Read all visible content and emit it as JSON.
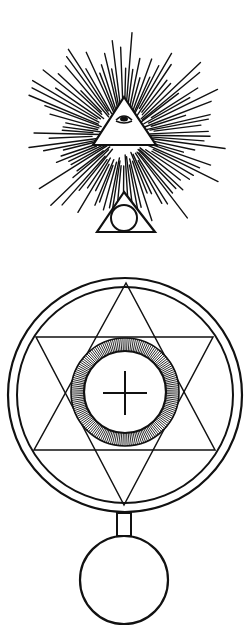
{
  "figure": {
    "colors": {
      "ink": "#111111",
      "paper": "#ffffff"
    },
    "upper_emblem": {
      "rays": {
        "center": [
          124,
          135
        ],
        "count": 96,
        "inner_radius": 30,
        "outer_radius_min": 58,
        "outer_radius_max": 108
      },
      "eye_triangle": {
        "points": [
          [
            124,
            97
          ],
          [
            93,
            145
          ],
          [
            156,
            145
          ]
        ]
      },
      "small_triangle": {
        "points": [
          [
            124,
            192
          ],
          [
            97,
            232
          ],
          [
            155,
            232
          ]
        ]
      },
      "small_circle": {
        "center": [
          124,
          218
        ],
        "r": 13
      }
    },
    "lower_emblem": {
      "outer_circle": {
        "center": [
          125,
          395
        ],
        "r": 117
      },
      "inner_circle": {
        "center": [
          125,
          395
        ],
        "r": 108
      },
      "hexagram": {
        "up_triangle": [
          [
            126,
            283
          ],
          [
            34,
            450
          ],
          [
            215,
            450
          ]
        ],
        "down_triangle": [
          [
            36,
            337
          ],
          [
            213,
            337
          ],
          [
            124,
            505
          ]
        ]
      },
      "hatched_ring": {
        "center": [
          125,
          392
        ],
        "outer_r": 54,
        "inner_r": 41,
        "ticks": 160
      },
      "cross": {
        "center": [
          125,
          393
        ],
        "half_width": 22,
        "half_height": 22
      },
      "stem": {
        "x": 117,
        "y": 513,
        "w": 14,
        "h": 23
      },
      "pendant_circle": {
        "center": [
          124,
          580
        ],
        "r": 44
      }
    }
  }
}
